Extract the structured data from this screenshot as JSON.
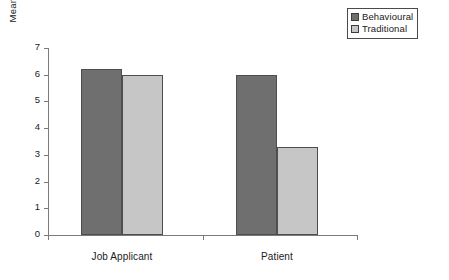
{
  "chart_data": {
    "type": "bar",
    "title": "",
    "xlabel": "",
    "ylabel": "Mean Adjustment Rating",
    "categories": [
      "Job Applicant",
      "Patient"
    ],
    "series": [
      {
        "name": "Behavioural",
        "color": "#6f6f6f",
        "values": [
          6.2,
          6.0
        ]
      },
      {
        "name": "Traditional",
        "color": "#c6c6c6",
        "values": [
          6.0,
          3.3
        ]
      }
    ],
    "ylim": [
      0,
      7
    ],
    "yticks": [
      "0",
      "1",
      "2",
      "3",
      "4",
      "5",
      "6",
      "7"
    ],
    "grid": false,
    "legend_position": "top-right"
  },
  "legend": {
    "items": [
      {
        "label": "Behavioural",
        "swatch": "legend-swatch-behavioural"
      },
      {
        "label": "Traditional",
        "swatch": "legend-swatch-traditional"
      }
    ]
  },
  "axes": {
    "y_title": "Mean Adjustment Rating",
    "y_tick_labels": [
      "7",
      "6",
      "5",
      "4",
      "3",
      "2",
      "1",
      "0"
    ],
    "x_tick_labels": [
      "Job Applicant",
      "Patient"
    ]
  },
  "colors": {
    "behavioural": "#6f6f6f",
    "traditional": "#c6c6c6",
    "axis": "#7a7a7a",
    "bar_border": "#4e4e4e",
    "text": "#1a1a1a"
  }
}
